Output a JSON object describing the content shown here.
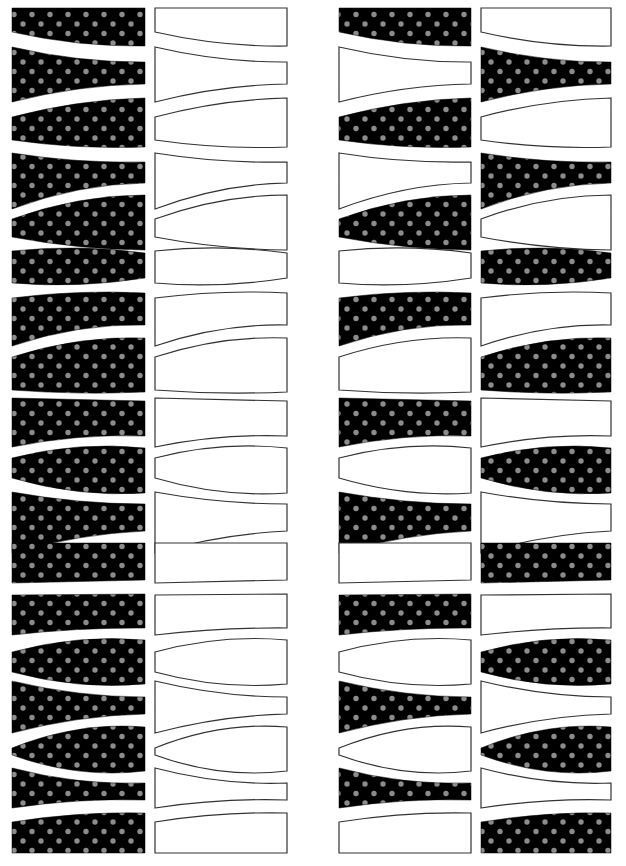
{
  "sheet": {
    "title": "",
    "columns": [
      {
        "id": "col-1",
        "style": "dotted-black"
      },
      {
        "id": "col-2",
        "style": "outline-white"
      },
      {
        "id": "col-3",
        "style": "alternate-start-black"
      },
      {
        "id": "col-4",
        "style": "alternate-start-white"
      }
    ],
    "colors": {
      "black_fill": "#000000",
      "dot_color": "#8c8c8c",
      "outline": "#333333",
      "background": "#ffffff"
    },
    "shape_count_per_column": 18
  }
}
